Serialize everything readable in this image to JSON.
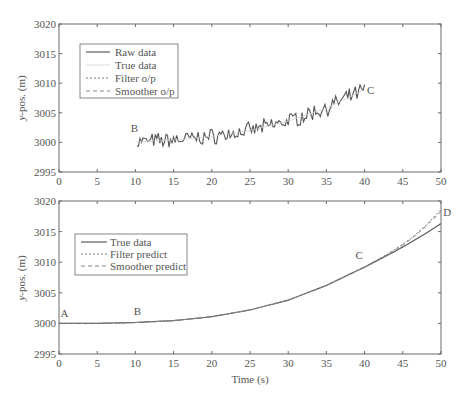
{
  "figure": {
    "width": 464,
    "height": 399
  },
  "colors": {
    "axis": "#6a6a6a",
    "raw": "#555555",
    "true": "#5a5a5a",
    "true_faint": "#d0d0d0",
    "filter": "#777777",
    "smoother": "#888888",
    "text": "#555555"
  },
  "chart_data": [
    {
      "type": "line",
      "panel": "top",
      "title": "",
      "xlabel": "",
      "ylabel": "y-pos. (m)",
      "xlim": [
        0,
        50
      ],
      "ylim": [
        2995,
        3020
      ],
      "xticks": [
        0,
        5,
        10,
        15,
        20,
        25,
        30,
        35,
        40,
        45,
        50
      ],
      "yticks": [
        2995,
        3000,
        3005,
        3010,
        3015,
        3020
      ],
      "grid": false,
      "legend_position": "upper-left",
      "legend": [
        {
          "label": "Raw data",
          "style": "solid"
        },
        {
          "label": "True data",
          "style": "solid-faint"
        },
        {
          "label": "Filter o/p",
          "style": "dotted"
        },
        {
          "label": "Smoother o/p",
          "style": "dashed"
        }
      ],
      "annotations": [
        {
          "text": "B",
          "x": 9.4,
          "y": 3001.8
        },
        {
          "text": "C",
          "x": 40.3,
          "y": 3008.2
        }
      ],
      "series": [
        {
          "name": "Raw data",
          "style": "solid",
          "x_start": 10.2,
          "x_end": 40,
          "x_step": 0.2,
          "trend_points": [
            [
              10,
              3000.1
            ],
            [
              15,
              3000.4
            ],
            [
              20,
              3001.0
            ],
            [
              25,
              3002.0
            ],
            [
              30,
              3003.6
            ],
            [
              35,
              3005.8
            ],
            [
              40,
              3008.9
            ]
          ],
          "noise_amplitude": 1.1
        },
        {
          "name": "True data",
          "style": "solid-faint",
          "x": [
            10,
            15,
            20,
            25,
            30,
            35,
            40
          ],
          "values": [
            3000.1,
            3000.4,
            3001.0,
            3002.0,
            3003.6,
            3005.8,
            3008.9
          ]
        }
      ]
    },
    {
      "type": "line",
      "panel": "bottom",
      "title": "",
      "xlabel": "Time (s)",
      "ylabel": "y-pos. (m)",
      "xlim": [
        0,
        50
      ],
      "ylim": [
        2995,
        3020
      ],
      "xticks": [
        0,
        5,
        10,
        15,
        20,
        25,
        30,
        35,
        40,
        45,
        50
      ],
      "yticks": [
        2995,
        3000,
        3005,
        3010,
        3015,
        3020
      ],
      "grid": false,
      "legend_position": "upper-left",
      "legend": [
        {
          "label": "True data",
          "style": "solid"
        },
        {
          "label": "Filter predict",
          "style": "dotted"
        },
        {
          "label": "Smoother predict",
          "style": "dashed"
        }
      ],
      "annotations": [
        {
          "text": "A",
          "x": 0.2,
          "y": 3001.0
        },
        {
          "text": "B",
          "x": 9.8,
          "y": 3001.4
        },
        {
          "text": "C",
          "x": 38.8,
          "y": 3010.5
        },
        {
          "text": "D",
          "x": 50.3,
          "y": 3017.6
        }
      ],
      "series": [
        {
          "name": "True data",
          "style": "solid",
          "x": [
            0,
            5,
            10,
            15,
            20,
            25,
            30,
            35,
            40,
            42,
            44,
            46,
            48,
            50
          ],
          "values": [
            3000.0,
            3000.0,
            3000.15,
            3000.45,
            3001.1,
            3002.2,
            3003.8,
            3006.2,
            3009.2,
            3010.5,
            3011.8,
            3013.2,
            3014.7,
            3016.3
          ]
        },
        {
          "name": "Filter predict",
          "style": "dotted",
          "x": [
            0,
            5,
            10,
            15,
            20,
            25,
            30,
            35,
            40,
            42,
            44,
            46,
            48,
            50
          ],
          "values": [
            3000.0,
            3000.0,
            3000.15,
            3000.45,
            3001.1,
            3002.2,
            3003.8,
            3006.2,
            3009.2,
            3010.6,
            3012.1,
            3013.8,
            3016.0,
            3018.6
          ]
        },
        {
          "name": "Smoother predict",
          "style": "dashed",
          "x": [
            0,
            5,
            10,
            15,
            20,
            25,
            30,
            35,
            40,
            42,
            44,
            46,
            48,
            50
          ],
          "values": [
            3000.0,
            3000.0,
            3000.15,
            3000.45,
            3001.1,
            3002.2,
            3003.8,
            3006.2,
            3009.2,
            3010.6,
            3012.0,
            3013.7,
            3015.8,
            3018.3
          ]
        }
      ]
    }
  ],
  "layout": {
    "panels": [
      {
        "left": 59,
        "top": 24,
        "right": 441,
        "bottom": 172,
        "legend_box": {
          "x": 80,
          "y": 44,
          "w": 98,
          "h": 54,
          "line_x0": 86,
          "line_x1": 110,
          "text_x": 115,
          "row0_y": 52,
          "row_h": 13
        }
      },
      {
        "left": 59,
        "top": 201,
        "right": 441,
        "bottom": 354,
        "legend_box": {
          "x": 75,
          "y": 234,
          "w": 112,
          "h": 41,
          "line_x0": 81,
          "line_x1": 107,
          "text_x": 110,
          "row0_y": 242,
          "row_h": 12
        }
      }
    ],
    "ylabel_positions": [
      {
        "x": 25,
        "y": 98
      },
      {
        "x": 25,
        "y": 278
      }
    ],
    "xlabel_position": {
      "x": 250,
      "y": 383
    }
  }
}
